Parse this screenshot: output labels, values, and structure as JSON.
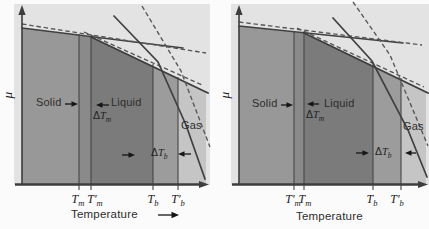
{
  "colors": {
    "page_bg": "#fbfbfb",
    "plot_bg": "#e3e3e3",
    "solid_region": "#989898",
    "melting_strip": "#8a8a8a",
    "liquid_region": "#7b7b7b",
    "boiling_strip": "#9c9c9c",
    "gas_region": "#c5c5c5",
    "solid_line": "#404040",
    "dashed_line": "#565656"
  },
  "panels": [
    {
      "mu_label": "μ",
      "labels": {
        "solid": "Solid",
        "liquid": "Liquid",
        "gas": "Gas"
      },
      "delta_tm": {
        "delta": "Δ",
        "base": "T",
        "sub": "m"
      },
      "delta_tb": {
        "delta": "Δ",
        "base": "T",
        "sub": "b"
      },
      "ticks": [
        {
          "base": "T",
          "prime": "",
          "sub": "m"
        },
        {
          "base": "T",
          "prime": "′",
          "sub": "m"
        },
        {
          "base": "T",
          "prime": "",
          "sub": "b"
        },
        {
          "base": "T",
          "prime": "′",
          "sub": "b"
        }
      ],
      "xlabel": "Temperature",
      "xlabel_arrow": "→"
    },
    {
      "mu_label": "μ",
      "labels": {
        "solid": "Solid",
        "liquid": "Liquid",
        "gas": "Gas"
      },
      "delta_tm": {
        "delta": "Δ",
        "base": "T",
        "sub": "m"
      },
      "delta_tb": {
        "delta": "Δ",
        "base": "T",
        "sub": "b"
      },
      "ticks": [
        {
          "base": "T",
          "prime": "′",
          "sub": "m"
        },
        {
          "base": "T",
          "prime": "",
          "sub": "m"
        },
        {
          "base": "T",
          "prime": "",
          "sub": "b"
        },
        {
          "base": "T",
          "prime": "′",
          "sub": "b"
        }
      ],
      "xlabel": "Temperature",
      "xlabel_arrow": ""
    }
  ]
}
